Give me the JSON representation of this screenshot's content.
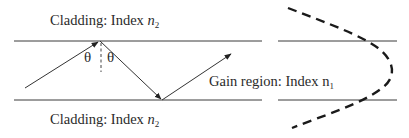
{
  "labels": {
    "cladding_top": {
      "prefix": "Cladding: Index ",
      "var": "n",
      "sub": "2"
    },
    "cladding_bottom": {
      "prefix": "Cladding: Index ",
      "var": "n",
      "sub": "2"
    },
    "gain_region": {
      "prefix": "Gain region: Index n",
      "sub": "1"
    },
    "theta_left": "θ",
    "theta_right": "θ"
  },
  "colors": {
    "line": "#3a3a3a",
    "dashed_curve": "#1a1a1a",
    "text": "#2a2a2a"
  },
  "geometry": {
    "top_boundary_y": 41,
    "bottom_boundary_y": 100,
    "ray_points": [
      [
        25,
        88
      ],
      [
        97,
        41
      ],
      [
        162,
        100
      ],
      [
        230,
        55
      ]
    ],
    "normal_x": 101
  }
}
